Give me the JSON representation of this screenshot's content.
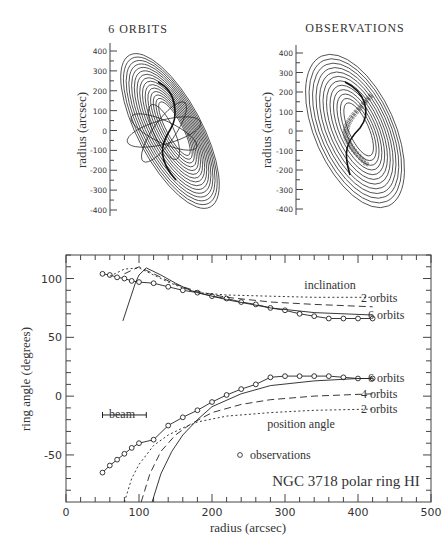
{
  "chart_data": [
    {
      "type": "line",
      "panel": "top-left",
      "title": "6 ORBITS",
      "ylabel": "radius (arcsec)",
      "ylim": [
        -400,
        400
      ],
      "yticks": [
        400,
        300,
        200,
        100,
        0,
        -100,
        -200,
        -300,
        -400
      ],
      "content": "Nested tilted elliptical ring orbits (model with 6 orbits) with crossing orbit ellipses near center"
    },
    {
      "type": "line",
      "panel": "top-right",
      "title": "OBSERVATIONS",
      "ylabel": "radius (arcsec)",
      "ylim": [
        -400,
        400
      ],
      "yticks": [
        400,
        300,
        200,
        100,
        0,
        -100,
        -200,
        -300,
        -400
      ],
      "content": "Nested tilted elliptical rings fitted to observations with S-shaped inner warp"
    },
    {
      "type": "line",
      "panel": "bottom",
      "title": "NGC 3718 polar ring HI",
      "xlabel": "radius (arcsec)",
      "ylabel": "ring angle (degrees)",
      "xlim": [
        0,
        500
      ],
      "ylim": [
        -90,
        120
      ],
      "xticks": [
        0,
        100,
        200,
        300,
        400,
        500
      ],
      "yticks": [
        100,
        50,
        0,
        -50
      ],
      "grid": false,
      "annotations": [
        "inclination",
        "position angle",
        "beam",
        "o observations",
        "NGC 3718 polar ring HI"
      ],
      "beam": {
        "x0": 50,
        "x1": 110,
        "y": -16
      },
      "series": [
        {
          "name": "inclination observations",
          "style": "circles",
          "x": [
            50,
            60,
            70,
            80,
            90,
            100,
            120,
            140,
            160,
            180,
            200,
            220,
            240,
            260,
            280,
            300,
            320,
            340,
            360,
            380,
            400,
            420
          ],
          "y": [
            104,
            103,
            101,
            100,
            98,
            97,
            96,
            93,
            90,
            88,
            85,
            83,
            80,
            78,
            75,
            73,
            70,
            68,
            66,
            66,
            66,
            66
          ]
        },
        {
          "name": "inclination 2 orbits",
          "style": "dotted",
          "label": "2 orbits",
          "x": [
            60,
            80,
            100,
            120,
            140,
            160,
            180,
            220,
            280,
            340,
            420
          ],
          "y": [
            102,
            108,
            109,
            103,
            97,
            92,
            88,
            86,
            85,
            84,
            84
          ]
        },
        {
          "name": "inclination 4 orbits",
          "style": "dashed",
          "x": [
            80,
            100,
            110,
            130,
            150,
            170,
            180,
            220,
            280,
            340,
            420
          ],
          "y": [
            104,
            110,
            107,
            101,
            95,
            91,
            89,
            84,
            80,
            78,
            76
          ]
        },
        {
          "name": "inclination 6 orbits",
          "style": "solid",
          "label": "6 orbits",
          "x": [
            78,
            95,
            100,
            110,
            130,
            150,
            170,
            180,
            220,
            280,
            340,
            420
          ],
          "y": [
            64,
            96,
            103,
            109,
            103,
            96,
            90,
            88,
            82,
            75,
            71,
            69
          ]
        },
        {
          "name": "position angle observations",
          "style": "circles",
          "x": [
            50,
            60,
            70,
            80,
            90,
            100,
            120,
            140,
            160,
            180,
            200,
            220,
            240,
            260,
            280,
            300,
            320,
            340,
            360,
            380,
            400,
            420
          ],
          "y": [
            -65,
            -59,
            -54,
            -49,
            -44,
            -40,
            -37,
            -25,
            -18,
            -12,
            -5,
            1,
            6,
            10,
            16,
            17,
            17,
            17,
            17,
            16,
            15,
            15
          ]
        },
        {
          "name": "position angle 2 orbits",
          "style": "dotted",
          "label": "2 orbits",
          "x": [
            80,
            90,
            100,
            120,
            140,
            160,
            180,
            220,
            280,
            340,
            420
          ],
          "y": [
            -90,
            -70,
            -58,
            -42,
            -33,
            -27,
            -22,
            -17,
            -14,
            -12,
            -11
          ]
        },
        {
          "name": "position angle 4 orbits",
          "style": "dashed",
          "label": "4 orbits",
          "x": [
            103,
            115,
            130,
            150,
            170,
            200,
            240,
            280,
            340,
            420
          ],
          "y": [
            -90,
            -66,
            -47,
            -33,
            -24,
            -14,
            -7,
            -3,
            0,
            2
          ]
        },
        {
          "name": "position angle 6 orbits",
          "style": "solid",
          "label": "6 orbits",
          "x": [
            118,
            130,
            145,
            160,
            180,
            200,
            240,
            280,
            340,
            400,
            420
          ],
          "y": [
            -90,
            -66,
            -47,
            -33,
            -20,
            -9,
            2,
            9,
            13,
            15,
            15
          ]
        }
      ]
    }
  ],
  "labels": {
    "top_left_title": "6 ORBITS",
    "top_right_title": "OBSERVATIONS",
    "top_ylabel": "radius (arcsec)",
    "bottom_ylabel": "ring angle (degrees)",
    "bottom_xlabel": "radius (arcsec)",
    "inclination": "inclination",
    "position_angle": "position angle",
    "beam": "beam",
    "observations": "observations",
    "galaxy": "NGC 3718 polar ring HI",
    "orbits2_top": "2 orbits",
    "orbits6_top": "6 orbits",
    "orbits6_bot": "6 orbits",
    "orbits4_bot": "4 orbits",
    "orbits2_bot": "2 orbits"
  }
}
